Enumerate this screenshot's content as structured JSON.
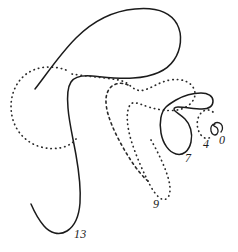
{
  "figure": {
    "canvas": {
      "width": 238,
      "height": 252
    },
    "colors": {
      "background": "#ffffff",
      "solid_stroke": "#1b1b1b",
      "dotted_stroke": "#2a2a2a",
      "label_color": "#1b1b1b"
    },
    "labels": [
      {
        "id": "label-13",
        "text": "13",
        "x": 77,
        "y": 234,
        "refers_to": "large-solid-outline"
      },
      {
        "id": "label-9",
        "text": "9",
        "x": 155,
        "y": 204,
        "refers_to": "large-dotted-outline"
      },
      {
        "id": "label-7",
        "text": "7",
        "x": 188,
        "y": 158,
        "refers_to": "solid-hook-shape"
      },
      {
        "id": "label-4",
        "text": "4",
        "x": 205,
        "y": 143,
        "refers_to": "small-dotted-arc"
      },
      {
        "id": "label-0",
        "text": "0",
        "x": 221,
        "y": 140,
        "refers_to": "tiny-solid-curl"
      }
    ],
    "shapes": [
      {
        "id": "large-solid-outline",
        "style": "solid",
        "label": "13"
      },
      {
        "id": "left-dotted-circle",
        "style": "dotted",
        "label": ""
      },
      {
        "id": "large-dotted-outline",
        "style": "dotted",
        "label": "9"
      },
      {
        "id": "inner-dotted-teardrop",
        "style": "dotted",
        "label": ""
      },
      {
        "id": "solid-hook-shape",
        "style": "solid",
        "label": "7"
      },
      {
        "id": "small-dotted-arc",
        "style": "dotted",
        "label": "4"
      },
      {
        "id": "tiny-solid-curl",
        "style": "solid",
        "label": "0"
      }
    ]
  }
}
